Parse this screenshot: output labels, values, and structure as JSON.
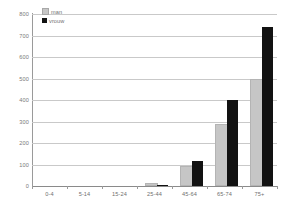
{
  "chart_data": {
    "type": "bar",
    "title": "",
    "subtitle": "",
    "xlabel": "",
    "ylabel": "",
    "categories": [
      "0-4",
      "5-14",
      "15-24",
      "25-44",
      "45-64",
      "65-74",
      "75+"
    ],
    "series": [
      {
        "name": "man",
        "color": "#c6c6c6",
        "values": [
          0,
          0,
          0,
          5,
          85,
          280,
          487
        ]
      },
      {
        "name": "vrouw",
        "color": "#121212",
        "values": [
          0,
          0,
          0,
          6,
          118,
          400,
          740
        ]
      }
    ],
    "ylim": [
      0,
      800
    ],
    "ytick_labels": [
      "800",
      "700",
      "600",
      "500",
      "400",
      "300",
      "200",
      "100",
      "0"
    ],
    "ytick_values": [
      800,
      700,
      600,
      500,
      400,
      300,
      200,
      100,
      0
    ],
    "ytick_step": 100,
    "grid": true,
    "grid_axis": "y",
    "legend_position": "top-left",
    "legend": [
      {
        "label": "man",
        "color": "#c6c6c6"
      },
      {
        "label": "vrouw",
        "color": "#121212"
      }
    ]
  },
  "legend": {
    "items": [
      {
        "label": "man",
        "swatch": "man-swatch-icon"
      },
      {
        "label": "vrouw",
        "swatch": "vrouw-swatch-icon"
      }
    ]
  },
  "colors": {
    "man": "#c6c6c6",
    "vrouw": "#121212",
    "gridline": "#c9c9c9",
    "axis": "#9a9a9a",
    "tick_text": "#6f6f6f",
    "background": "#ffffff"
  }
}
